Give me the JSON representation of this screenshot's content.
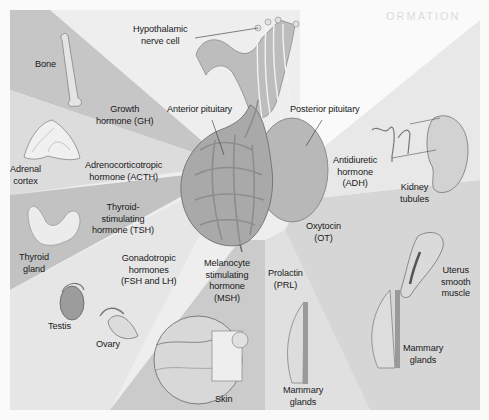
{
  "diagram": {
    "title_fragment": "ORMATION",
    "center": {
      "hypothalamic": [
        "Hypothalamic",
        "nerve cell"
      ],
      "anterior": "Anterior pituitary",
      "posterior": "Posterior pituitary"
    },
    "hormones": {
      "gh": [
        "Growth",
        "hormone (GH)"
      ],
      "acth": [
        "Adrenocorticotropic",
        "hormone (ACTH)"
      ],
      "tsh": [
        "Thyroid-",
        "stimulating",
        "hormone (TSH)"
      ],
      "fsh_lh": [
        "Gonadotropic",
        "hormones",
        "(FSH and LH)"
      ],
      "msh": [
        "Melanocyte",
        "stimulating",
        "hormone",
        "(MSH)"
      ],
      "prl": [
        "Prolactin",
        "(PRL)"
      ],
      "ot": [
        "Oxytocin",
        "(OT)"
      ],
      "adh": [
        "Antidiuretic",
        "hormone",
        "(ADH)"
      ]
    },
    "targets": {
      "bone": "Bone",
      "adrenal": [
        "Adrenal",
        "cortex"
      ],
      "thyroid": [
        "Thyroid",
        "gland"
      ],
      "testis": "Testis",
      "ovary": "Ovary",
      "skin": "Skin",
      "mammary_prl": [
        "Mammary",
        "glands"
      ],
      "mammary_ot": [
        "Mammary",
        "glands"
      ],
      "uterus": [
        "Uterus",
        "smooth",
        "muscle"
      ],
      "kidney": [
        "Kidney",
        "tubules"
      ]
    },
    "colors": {
      "wedge_dark": "#c4c4c4",
      "wedge_mid": "#d4d4d4",
      "wedge_light": "#e4e4e4",
      "gland": "#b3b3b3",
      "text": "#1a1a1a"
    }
  }
}
